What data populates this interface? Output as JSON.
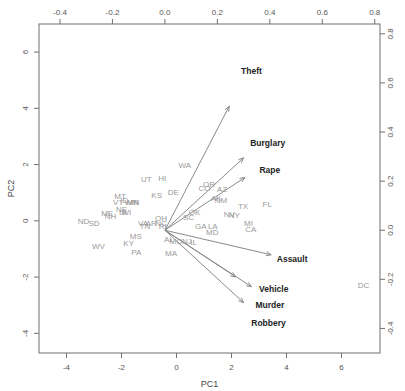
{
  "chart_data": {
    "type": "scatter",
    "title": "",
    "subtitle": "",
    "xlabel": "PC1",
    "ylabel": "PC2",
    "legend": [],
    "grid": false,
    "axes": {
      "bottom": {
        "label": "PC1",
        "ticks": [
          "-4",
          "-2",
          "0",
          "2",
          "4",
          "6"
        ],
        "values": [
          -4,
          -2,
          0,
          2,
          4,
          6
        ],
        "range": [
          -5.0,
          7.4
        ]
      },
      "left": {
        "label": "PC2",
        "ticks": [
          "6",
          "4",
          "2",
          "0",
          "-2",
          "-4"
        ],
        "values": [
          6,
          4,
          2,
          0,
          -2,
          -4
        ],
        "range": [
          -4.7,
          7.0
        ]
      },
      "top": {
        "label": "",
        "ticks": [
          "-0.4",
          "-0.2",
          "0.0",
          "0.2",
          "0.4",
          "0.6",
          "0.8"
        ],
        "values": [
          -0.4,
          -0.2,
          0.0,
          0.2,
          0.4,
          0.6,
          0.8
        ],
        "range": [
          -0.48,
          0.82
        ]
      },
      "right": {
        "label": "",
        "ticks": [
          "0.8",
          "0.6",
          "0.4",
          "0.2",
          "0.0",
          "-0.2",
          "-0.4"
        ],
        "values": [
          0.8,
          0.6,
          0.4,
          0.2,
          0.0,
          -0.2,
          -0.4
        ],
        "range": [
          -0.5,
          0.84
        ]
      }
    },
    "points": [
      {
        "label": "ND",
        "x": -3.38,
        "y": -0.11
      },
      {
        "label": "SD",
        "x": -3.0,
        "y": -0.18
      },
      {
        "label": "WV",
        "x": -2.84,
        "y": -1.0
      },
      {
        "label": "ME",
        "x": -2.52,
        "y": 0.18
      },
      {
        "label": "NH",
        "x": -2.4,
        "y": 0.06
      },
      {
        "label": "VT",
        "x": -2.12,
        "y": 0.55
      },
      {
        "label": "MT",
        "x": -2.05,
        "y": 0.78
      },
      {
        "label": "ID",
        "x": -1.9,
        "y": 0.62
      },
      {
        "label": "NE",
        "x": -2.0,
        "y": 0.3
      },
      {
        "label": "IA",
        "x": -1.95,
        "y": 0.22
      },
      {
        "label": "WI",
        "x": -1.82,
        "y": 0.22
      },
      {
        "label": "WY",
        "x": -1.66,
        "y": 0.55
      },
      {
        "label": "IN",
        "x": -1.52,
        "y": 0.55
      },
      {
        "label": "MN",
        "x": -1.58,
        "y": 0.55
      },
      {
        "label": "KY",
        "x": -1.74,
        "y": -0.88
      },
      {
        "label": "PA",
        "x": -1.46,
        "y": -1.22
      },
      {
        "label": "MS",
        "x": -1.48,
        "y": -0.66
      },
      {
        "label": "VA",
        "x": -1.22,
        "y": -0.18
      },
      {
        "label": "TN",
        "x": -1.15,
        "y": -0.3
      },
      {
        "label": "AR",
        "x": -0.92,
        "y": -0.18
      },
      {
        "label": "UT",
        "x": -1.1,
        "y": 1.38
      },
      {
        "label": "KS",
        "x": -0.72,
        "y": 0.82
      },
      {
        "label": "HI",
        "x": -0.52,
        "y": 1.4
      },
      {
        "label": "OH",
        "x": -0.56,
        "y": -0.02
      },
      {
        "label": "NC",
        "x": -0.56,
        "y": -0.18
      },
      {
        "label": "RI",
        "x": -0.5,
        "y": -0.3
      },
      {
        "label": "DE",
        "x": -0.12,
        "y": 0.92
      },
      {
        "label": "AL",
        "x": -0.28,
        "y": -0.75
      },
      {
        "label": "MO",
        "x": -0.02,
        "y": -0.82
      },
      {
        "label": "MA",
        "x": -0.2,
        "y": -1.25
      },
      {
        "label": "NJ",
        "x": 0.38,
        "y": -0.82
      },
      {
        "label": "IL",
        "x": 0.62,
        "y": -0.86
      },
      {
        "label": "SC",
        "x": 0.44,
        "y": 0.02
      },
      {
        "label": "OK",
        "x": 0.66,
        "y": 0.2
      },
      {
        "label": "GA",
        "x": 0.88,
        "y": -0.28
      },
      {
        "label": "LA",
        "x": 1.32,
        "y": -0.28
      },
      {
        "label": "MD",
        "x": 1.3,
        "y": -0.52
      },
      {
        "label": "CO",
        "x": 1.02,
        "y": 1.05
      },
      {
        "label": "OR",
        "x": 1.18,
        "y": 1.22
      },
      {
        "label": "AK",
        "x": 1.44,
        "y": 0.72
      },
      {
        "label": "AZ",
        "x": 1.66,
        "y": 1.02
      },
      {
        "label": "NM",
        "x": 1.62,
        "y": 0.62
      },
      {
        "label": "WA",
        "x": 0.3,
        "y": 1.88
      },
      {
        "label": "NV",
        "x": 1.92,
        "y": 0.12
      },
      {
        "label": "TX",
        "x": 2.42,
        "y": 0.42
      },
      {
        "label": "MI",
        "x": 2.62,
        "y": -0.18
      },
      {
        "label": "CA",
        "x": 2.7,
        "y": -0.4
      },
      {
        "label": "NY",
        "x": 2.1,
        "y": 0.1
      },
      {
        "label": "FL",
        "x": 3.3,
        "y": 0.48
      },
      {
        "label": "DC",
        "x": 6.8,
        "y": -2.38
      }
    ],
    "vectors": [
      {
        "label": "Theft",
        "x": 0.245,
        "y": 0.505,
        "label_x": 0.33,
        "label_y": 0.635
      },
      {
        "label": "Burglary",
        "x": 0.3,
        "y": 0.295,
        "label_x": 0.392,
        "label_y": 0.345
      },
      {
        "label": "Rape",
        "x": 0.305,
        "y": 0.215,
        "label_x": 0.4,
        "label_y": 0.232
      },
      {
        "label": "Assault",
        "x": 0.405,
        "y": -0.1,
        "label_x": 0.485,
        "label_y": -0.13
      },
      {
        "label": "Vehicle",
        "x": 0.33,
        "y": -0.23,
        "label_x": 0.415,
        "label_y": -0.25
      },
      {
        "label": "Murder",
        "x": 0.3,
        "y": -0.295,
        "label_x": 0.4,
        "label_y": -0.318
      },
      {
        "label": "Robbery",
        "x": 0.27,
        "y": -0.19,
        "label_x": 0.395,
        "label_y": -0.39
      }
    ],
    "colors": {
      "observations": "#9a9a9a",
      "variables": "#222222",
      "arrows": "#8a8a8a",
      "frame": "#6f6f6f"
    }
  }
}
